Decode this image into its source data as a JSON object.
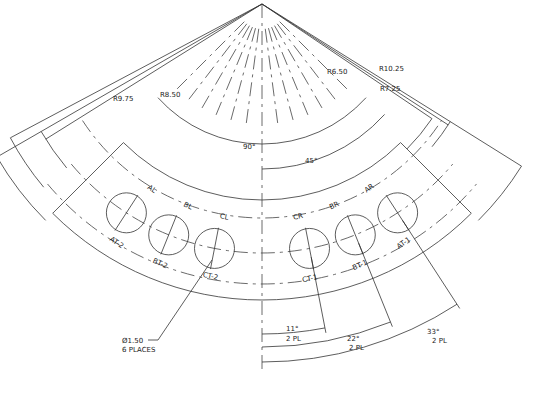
{
  "drawing": {
    "center": {
      "x": 262,
      "y": 4
    },
    "radii_labels": [
      "R6.50",
      "R7.25",
      "R8.50",
      "R9.75",
      "R10.25"
    ],
    "angle_labels": {
      "outer_span": "90°",
      "inner_span": "45°"
    },
    "hole_labels_top": [
      "AL",
      "BL",
      "CL",
      "CR",
      "BR",
      "AR"
    ],
    "hole_labels_bottom": [
      "AT-2",
      "BT-2",
      "CT-2",
      "CT-1",
      "BT-1",
      "AT-1"
    ],
    "hole_callout": {
      "line1": "Ø1.50",
      "line2": "6 PLACES"
    },
    "angular_dims": [
      {
        "angle": "11°",
        "note": "2 PL"
      },
      {
        "angle": "22°",
        "note": "2 PL"
      },
      {
        "angle": "33°",
        "note": "2 PL"
      }
    ]
  }
}
